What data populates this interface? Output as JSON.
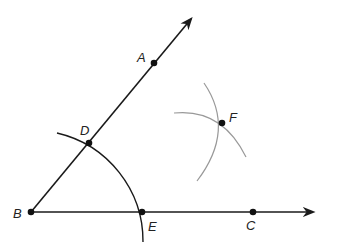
{
  "diagram": {
    "type": "angle-bisector-construction",
    "colors": {
      "line": "#1a1a1a",
      "construction_arc": "#999999",
      "point": "#111111"
    },
    "points": {
      "A": {
        "label": "A",
        "x": 154,
        "y": 63
      },
      "B": {
        "label": "B",
        "x": 31,
        "y": 212
      },
      "C": {
        "label": "C",
        "x": 253,
        "y": 212
      },
      "D": {
        "label": "D",
        "x": 89,
        "y": 143
      },
      "E": {
        "label": "E",
        "x": 142,
        "y": 212
      },
      "F": {
        "label": "F",
        "x": 222,
        "y": 123
      }
    },
    "rays": [
      "BA",
      "BC"
    ],
    "arcs": [
      "arc centered at B through D and E",
      "arc centered at D through F",
      "arc centered at E through F"
    ]
  }
}
